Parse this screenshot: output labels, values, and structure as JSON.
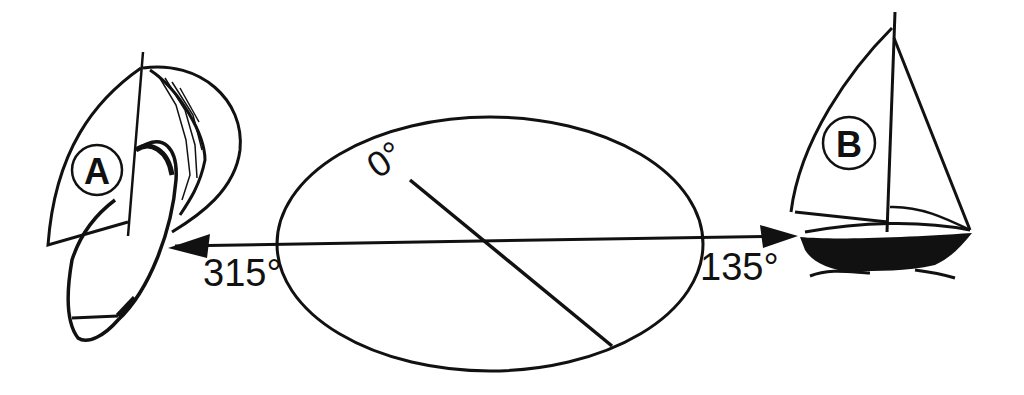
{
  "diagram": {
    "colors": {
      "ink": "#111111",
      "background": "#ffffff"
    },
    "boat_a": {
      "label": "A",
      "bearing_label": "315°"
    },
    "boat_b": {
      "label": "B",
      "bearing_label": "135°"
    },
    "compass": {
      "north_label": "0°"
    }
  }
}
